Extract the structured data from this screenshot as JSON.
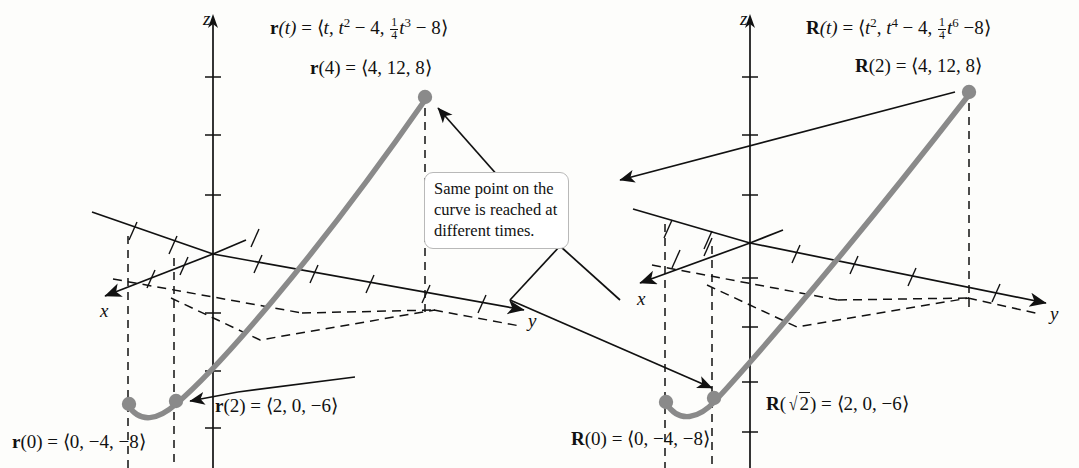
{
  "figure": {
    "background_color": "#fdfdfb",
    "curve_color": "#8a8a8a",
    "axis_color": "#111111",
    "callout": {
      "line1": "Same point on the",
      "line2": "curve is reached at",
      "line3": "different times."
    },
    "left_panel": {
      "axis_x_label": "x",
      "axis_y_label": "y",
      "axis_z_label": "z",
      "function_label": "r(t) = ⟨t, t² − 4, ¼t³ − 8⟩",
      "point_top_label": "r(4) = ⟨4, 12, 8⟩",
      "point_mid_label": "r(2) = ⟨2, 0, −6⟩",
      "point_start_label": "r(0) = ⟨0, −4, −8⟩",
      "parts": {
        "fn_name": "r",
        "fn_arg": "(t)",
        "eq": " = ",
        "open": "⟨",
        "comp1": "t",
        "comp2_base": "t",
        "comp2_exp": "2",
        "comp2_tail": " − 4",
        "frac_num": "1",
        "frac_den": "4",
        "comp3_base": "t",
        "comp3_exp": "3",
        "comp3_tail": " − 8",
        "close": "⟩",
        "p_top_name": "r",
        "p_top_arg": "(4)",
        "p_top_val": " = ⟨4, 12, 8⟩",
        "p_mid_name": "r",
        "p_mid_arg": "(2)",
        "p_mid_val": " = ⟨2, 0, −6⟩",
        "p_start_name": "r",
        "p_start_arg": "(0)",
        "p_start_val": " = ⟨0, −4, −8⟩"
      }
    },
    "right_panel": {
      "axis_x_label": "x",
      "axis_y_label": "y",
      "axis_z_label": "z",
      "function_label": "R(t) = ⟨t², t⁴ − 4, ¼t⁶ − 8⟩",
      "point_top_label": "R(2) = ⟨4, 12, 8⟩",
      "point_mid_label": "R(√2) = ⟨2, 0, −6⟩",
      "point_start_label": "R(0) = ⟨0, −4, −8⟩",
      "parts": {
        "fn_name": "R",
        "fn_arg": "(t)",
        "eq": " = ",
        "open": "⟨",
        "comp1_base": "t",
        "comp1_exp": "2",
        "comp1_tail": ", ",
        "comp2_base": "t",
        "comp2_exp": "4",
        "comp2_tail": " − 4",
        "frac_num": "1",
        "frac_den": "4",
        "comp3_base": "t",
        "comp3_exp": "6",
        "comp3_tail": " −8",
        "close": "⟩",
        "p_top_name": "R",
        "p_top_arg": "(2)",
        "p_top_val": " = ⟨4, 12, 8⟩",
        "p_mid_name": "R",
        "p_mid_arg_open": "(",
        "p_mid_radicand": "2",
        "p_mid_arg_close": ")",
        "p_mid_val": " = ⟨2, 0, −6⟩",
        "p_start_name": "R",
        "p_start_arg": "(0)",
        "p_start_val": " = ⟨0, −4, −8⟩"
      }
    }
  }
}
